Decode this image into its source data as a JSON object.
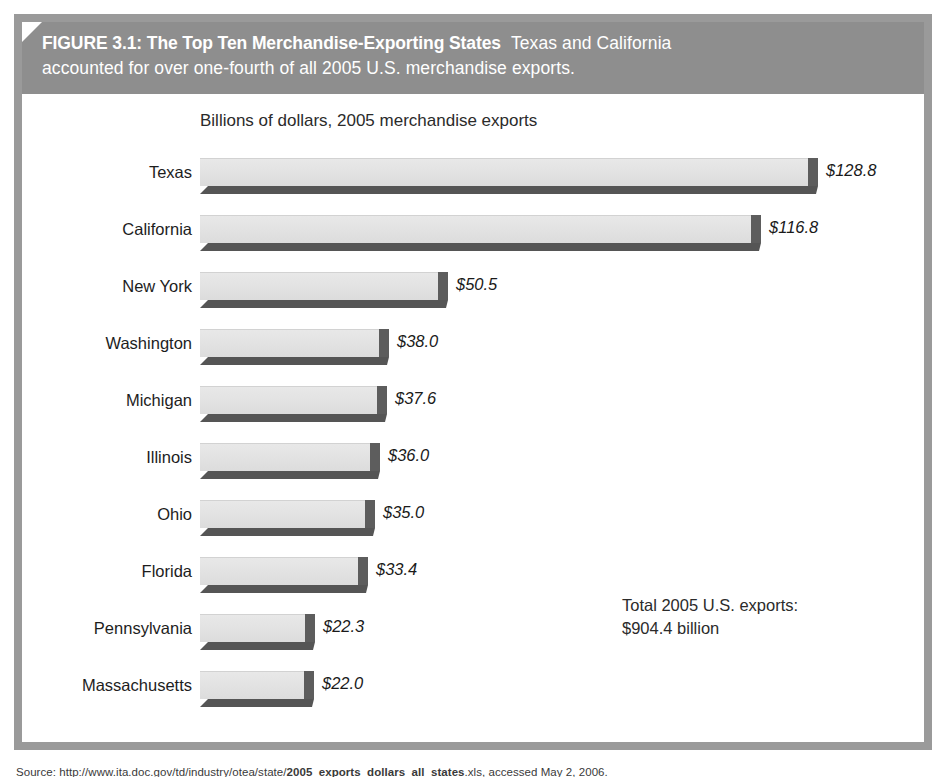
{
  "figure": {
    "header_label": "FIGURE 3.1:",
    "header_title": "The Top Ten Merchandise-Exporting States",
    "header_caption_1": "Texas and California",
    "header_caption_2": "accounted for over one-fourth of all 2005 U.S. merchandise exports.",
    "total_note_line1": "Total 2005 U.S. exports:",
    "total_note_line2": "$904.4 billion",
    "source_prefix": "Source: ",
    "source_url": "http://www.ita.doc.gov/td/industry/otea/state/",
    "source_file": "2005_exports_dollars",
    "source_ext": "_all_states",
    "source_suffix": ".xls, accessed May 2, 2006."
  },
  "colors": {
    "frame": "#9a9a9a",
    "header_band": "#8e8e8e",
    "bar_face": "#e3e3e3",
    "bar_side": "#5d5d5d",
    "bar_shadow": "#555555",
    "text": "#1d1d1d"
  },
  "chart_data": {
    "type": "bar",
    "orientation": "horizontal",
    "title": "Billions of dollars, 2005 merchandise exports",
    "xlabel": "",
    "ylabel": "",
    "xlim": [
      0,
      128.8
    ],
    "grid": false,
    "legend": null,
    "value_prefix": "$",
    "categories": [
      "Texas",
      "California",
      "New York",
      "Washington",
      "Michigan",
      "Illinois",
      "Ohio",
      "Florida",
      "Pennsylvania",
      "Massachusetts"
    ],
    "values": [
      128.8,
      116.8,
      50.5,
      38.0,
      37.6,
      36.0,
      35.0,
      33.4,
      22.3,
      22.0
    ],
    "value_labels": [
      "$128.8",
      "$116.8",
      "$50.5",
      "$38.0",
      "$37.6",
      "$36.0",
      "$35.0",
      "$33.4",
      "$22.3",
      "$22.0"
    ],
    "annotations": [
      "Total 2005 U.S. exports:",
      "$904.4 billion"
    ]
  }
}
